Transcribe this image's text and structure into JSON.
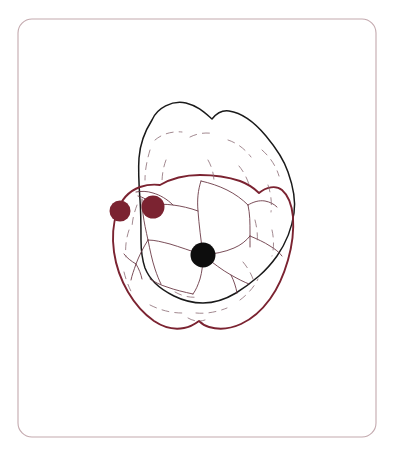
{
  "figure": {
    "title": "Tooth occlusal surface annotation diagram",
    "canvas": {
      "width": 394,
      "height": 456,
      "background_color": "#ffffff"
    },
    "frame": {
      "name": "rounded-border-frame",
      "x": 18,
      "y": 19,
      "width": 358,
      "height": 418,
      "corner_radius": 14,
      "stroke_color": "#c3a9ae",
      "stroke_width": 1.1
    },
    "outlines": [
      {
        "id": "upper-tooth-outline",
        "label": "Upper tooth crown outline",
        "stroke_color": "#1a1a1a",
        "stroke_width": 1.5,
        "fill": "#ffffff"
      },
      {
        "id": "lower-tooth-outline",
        "label": "Lower traced tooth outline",
        "stroke_color": "#7b2331",
        "stroke_width": 1.9,
        "fill": "none"
      }
    ],
    "fissure_lines": {
      "label": "Occlusal fissure and groove pattern",
      "stroke_color": "#6b3a46",
      "stroke_width": 0.9
    },
    "contour_hints": {
      "label": "Enamel ridge dashed contours",
      "stroke_color": "#8a6b74",
      "stroke_width": 0.8,
      "dash": "7 6"
    },
    "markers": [
      {
        "id": "marker-1",
        "label": "Maroon marker left",
        "cx": 120,
        "cy": 211,
        "r": 10.5,
        "color": "#7b2331"
      },
      {
        "id": "marker-2",
        "label": "Maroon marker mid-left",
        "cx": 153,
        "cy": 207,
        "r": 11.5,
        "color": "#7b2331"
      },
      {
        "id": "marker-3",
        "label": "Black marker center",
        "cx": 203,
        "cy": 255,
        "r": 12.5,
        "color": "#0d0d0d"
      }
    ],
    "colors": {
      "maroon": "#7b2331",
      "black": "#0d0d0d",
      "frame": "#c3a9ae",
      "fissure": "#6b3a46",
      "background": "#ffffff"
    }
  }
}
